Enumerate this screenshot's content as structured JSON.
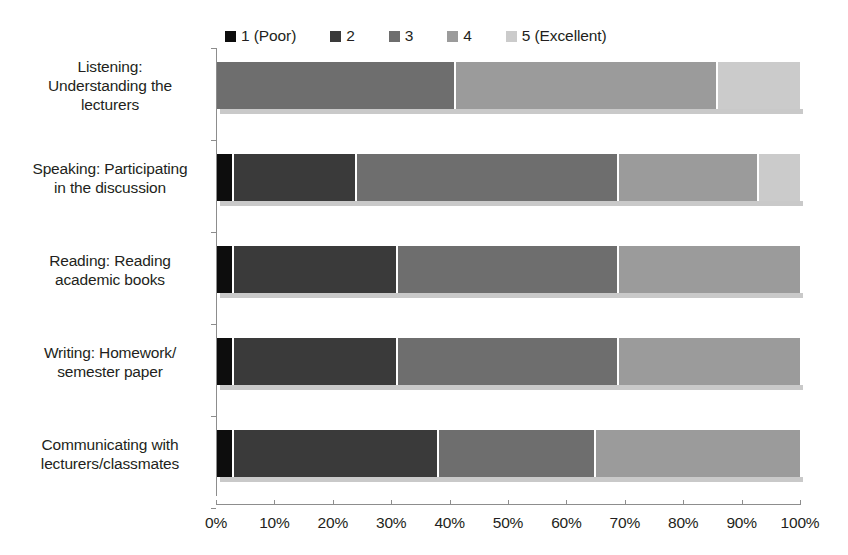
{
  "chart_data": {
    "type": "bar",
    "subtype": "horizontal-100-percent-stacked",
    "title": "",
    "xlabel": "",
    "ylabel": "",
    "xlim": [
      0,
      100
    ],
    "grid": false,
    "legend_position": "top",
    "categories": [
      "Listening: Understanding the lecturers",
      "Speaking: Participating in the discussion",
      "Reading: Reading academic books",
      "Writing: Homework/ semester paper",
      "Communicating with lecturers/classmates"
    ],
    "series": [
      {
        "name": "1 (Poor)",
        "color": "#0d0d0d",
        "values": [
          0,
          3,
          3,
          3,
          3
        ]
      },
      {
        "name": "2",
        "color": "#3a3a3a",
        "values": [
          0,
          21,
          28,
          28,
          35
        ]
      },
      {
        "name": "3",
        "color": "#6e6e6e",
        "values": [
          41,
          45,
          38,
          38,
          27
        ]
      },
      {
        "name": "4",
        "color": "#9b9b9b",
        "values": [
          45,
          24,
          31,
          31,
          35
        ]
      },
      {
        "name": "5 (Excellent)",
        "color": "#cbcbcb",
        "values": [
          14,
          7,
          0,
          0,
          0
        ]
      }
    ],
    "xticks": [
      0,
      10,
      20,
      30,
      40,
      50,
      60,
      70,
      80,
      90,
      100
    ],
    "xtick_labels": [
      "0%",
      "10%",
      "20%",
      "30%",
      "40%",
      "50%",
      "60%",
      "70%",
      "80%",
      "90%",
      "100%"
    ]
  },
  "legend": {
    "items": [
      {
        "label": "1 (Poor)",
        "color": "#0d0d0d"
      },
      {
        "label": "2",
        "color": "#3a3a3a"
      },
      {
        "label": "3",
        "color": "#6e6e6e"
      },
      {
        "label": "4",
        "color": "#9b9b9b"
      },
      {
        "label": "5 (Excellent)",
        "color": "#cbcbcb"
      }
    ]
  },
  "category_labels": [
    {
      "lines": [
        "Listening:",
        "Understanding the",
        "lecturers"
      ]
    },
    {
      "lines": [
        "Speaking: Participating",
        "in the discussion"
      ]
    },
    {
      "lines": [
        "Reading: Reading",
        "academic books"
      ]
    },
    {
      "lines": [
        "Writing: Homework/",
        "semester paper"
      ]
    },
    {
      "lines": [
        "Communicating with",
        "lecturers/classmates"
      ]
    }
  ]
}
